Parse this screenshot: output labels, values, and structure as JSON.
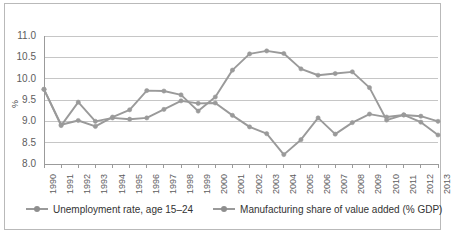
{
  "chart_data": {
    "type": "line",
    "title": "",
    "xlabel": "",
    "ylabel": "%",
    "ylim": [
      8.0,
      11.0
    ],
    "ytick_step": 0.5,
    "yticks": [
      "8.0",
      "8.5",
      "9.0",
      "9.5",
      "10.0",
      "10.5",
      "11.0"
    ],
    "grid": true,
    "grid_axis": "y",
    "legend_position": "bottom",
    "categories": [
      "1990",
      "1991",
      "1992",
      "1993",
      "1994",
      "1995",
      "1996",
      "1997",
      "1998",
      "1999",
      "2000",
      "2001",
      "2002",
      "2003",
      "2004",
      "2005",
      "2006",
      "2007",
      "2008",
      "2009",
      "2010",
      "2011",
      "2012",
      "2013"
    ],
    "series": [
      {
        "name": "Unemployment rate, age 15–24",
        "color": "#9a9a9a",
        "values": [
          9.75,
          8.9,
          9.45,
          9.0,
          9.08,
          9.05,
          9.08,
          9.28,
          9.48,
          9.42,
          9.43,
          9.14,
          8.87,
          8.71,
          8.22,
          8.57,
          9.08,
          8.7,
          8.97,
          9.17,
          9.1,
          9.15,
          9.12,
          9.0
        ]
      },
      {
        "name": "Manufacturing share of value added (% GDP)",
        "color": "#9a9a9a",
        "values": [
          9.75,
          8.92,
          9.02,
          8.88,
          9.1,
          9.27,
          9.72,
          9.71,
          9.62,
          9.24,
          9.57,
          10.2,
          10.58,
          10.65,
          10.59,
          10.23,
          10.08,
          10.12,
          10.16,
          9.79,
          9.03,
          9.15,
          8.98,
          8.68
        ]
      }
    ]
  },
  "legend": {
    "entries": [
      {
        "label": "Unemployment rate, age 15–24"
      },
      {
        "label": "Manufacturing share of value added (% GDP)"
      }
    ]
  },
  "source_note": ""
}
